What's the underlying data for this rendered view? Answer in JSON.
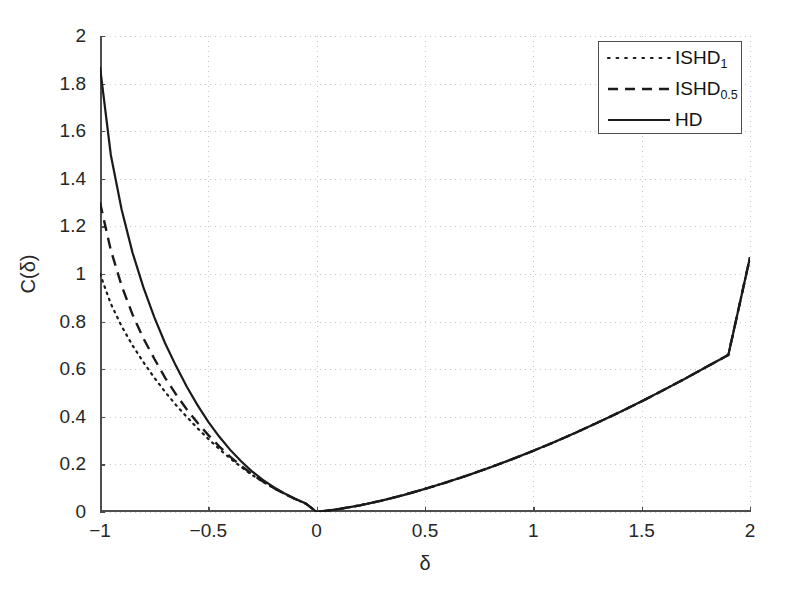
{
  "chart_data": {
    "type": "line",
    "title": "",
    "xlabel": "δ",
    "ylabel": "C(δ)",
    "xlim": [
      -1,
      2
    ],
    "ylim": [
      0,
      2
    ],
    "xticks": [
      "-1",
      "-0.5",
      "0",
      "0.5",
      "1",
      "1.5",
      "2"
    ],
    "xtick_values": [
      -1,
      -0.5,
      0,
      0.5,
      1,
      1.5,
      2
    ],
    "yticks": [
      "0",
      "0.2",
      "0.4",
      "0.6",
      "0.8",
      "1",
      "1.2",
      "1.4",
      "1.6",
      "1.8",
      "2"
    ],
    "ytick_values": [
      0,
      0.2,
      0.4,
      0.6,
      0.8,
      1,
      1.2,
      1.4,
      1.6,
      1.8,
      2
    ],
    "grid": true,
    "legend_position": "top-right",
    "x": [
      -1,
      -0.95,
      -0.9,
      -0.85,
      -0.8,
      -0.75,
      -0.7,
      -0.65,
      -0.6,
      -0.55,
      -0.5,
      -0.45,
      -0.4,
      -0.35,
      -0.3,
      -0.25,
      -0.2,
      -0.15,
      -0.1,
      -0.05,
      0,
      0.1,
      0.2,
      0.3,
      0.4,
      0.5,
      0.6,
      0.7,
      0.8,
      0.9,
      1,
      1.1,
      1.2,
      1.3,
      1.4,
      1.5,
      1.6,
      1.7,
      1.8,
      1.9,
      2
    ],
    "series": [
      {
        "name": "ISHD",
        "sub": "1",
        "label": "ISHD₁",
        "style": "dotted",
        "color": "#1a1a1a",
        "values": [
          1.0,
          0.875,
          0.78,
          0.7,
          0.63,
          0.565,
          0.505,
          0.45,
          0.4,
          0.352,
          0.307,
          0.265,
          0.226,
          0.19,
          0.157,
          0.128,
          0.101,
          0.077,
          0.055,
          0.035,
          0.0,
          0.012,
          0.028,
          0.048,
          0.071,
          0.097,
          0.125,
          0.155,
          0.187,
          0.221,
          0.257,
          0.295,
          0.335,
          0.377,
          0.42,
          0.465,
          0.512,
          0.56,
          0.61,
          0.66,
          1.07
        ]
      },
      {
        "name": "ISHD",
        "sub": "0.5",
        "label": "ISHD₀.₅",
        "style": "dashed",
        "color": "#1a1a1a",
        "values": [
          1.3,
          1.1,
          0.95,
          0.83,
          0.73,
          0.645,
          0.565,
          0.495,
          0.432,
          0.375,
          0.323,
          0.276,
          0.233,
          0.195,
          0.16,
          0.129,
          0.102,
          0.077,
          0.055,
          0.035,
          0.0,
          0.012,
          0.028,
          0.048,
          0.071,
          0.097,
          0.125,
          0.155,
          0.187,
          0.221,
          0.257,
          0.295,
          0.335,
          0.377,
          0.42,
          0.465,
          0.512,
          0.56,
          0.61,
          0.66,
          1.07
        ]
      },
      {
        "name": "HD",
        "sub": "",
        "label": "HD",
        "style": "solid",
        "color": "#1a1a1a",
        "values": [
          1.87,
          1.5,
          1.27,
          1.09,
          0.945,
          0.82,
          0.71,
          0.615,
          0.527,
          0.449,
          0.379,
          0.317,
          0.262,
          0.214,
          0.172,
          0.136,
          0.105,
          0.079,
          0.056,
          0.036,
          0.0,
          0.012,
          0.028,
          0.048,
          0.071,
          0.097,
          0.125,
          0.155,
          0.187,
          0.221,
          0.257,
          0.295,
          0.335,
          0.377,
          0.42,
          0.465,
          0.512,
          0.56,
          0.61,
          0.66,
          1.07
        ]
      }
    ]
  },
  "axes": {
    "x_title": "δ",
    "y_title": "C(δ)"
  },
  "legend": {
    "entries": [
      {
        "label_main": "ISHD",
        "label_sub": "1",
        "style": "dotted"
      },
      {
        "label_main": "ISHD",
        "label_sub": "0.5",
        "style": "dashed"
      },
      {
        "label_main": "HD",
        "label_sub": "",
        "style": "solid"
      }
    ]
  },
  "colors": {
    "curve": "#1a1a1a",
    "axis": "#4d4d4d",
    "grid": "#c8c8c8",
    "background": "#ffffff"
  }
}
